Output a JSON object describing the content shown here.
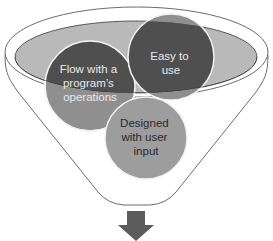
{
  "diagram": {
    "type": "funnel",
    "circles": [
      {
        "id": "flow",
        "lines": [
          "Flow with a",
          "program’s",
          "operations"
        ]
      },
      {
        "id": "easy",
        "lines": [
          "Easy to",
          "use"
        ]
      },
      {
        "id": "designed",
        "lines": [
          "Designed",
          "with user",
          "input"
        ]
      }
    ],
    "colors": {
      "funnel_stroke": "#5a5a5a",
      "ellipse_fill": "#b9b9b9",
      "circle_dark": "#4f4f4f",
      "circle_mid": "#8f8f8f",
      "circle_light": "#9d9d9d",
      "text_light": "#e8e8e8",
      "text_dark": "#2a2a2a",
      "arrow": "#5c5c5c"
    }
  }
}
